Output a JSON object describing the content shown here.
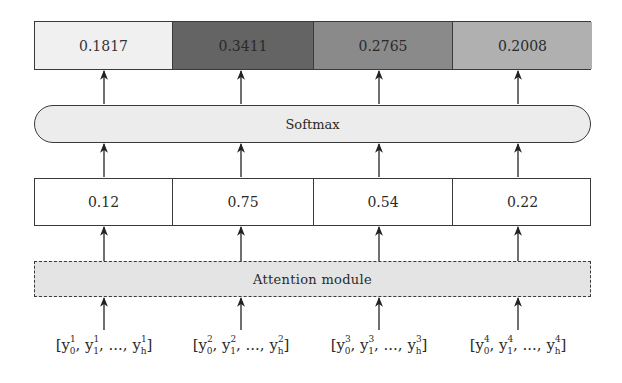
{
  "diagram": {
    "probabilities": [
      {
        "value": "0.1817",
        "fill": "#f0f0f0",
        "text_color": "#333333"
      },
      {
        "value": "0.3411",
        "fill": "#646464",
        "text_color": "#2a2a2a"
      },
      {
        "value": "0.2765",
        "fill": "#8a8a8a",
        "text_color": "#2a2a2a"
      },
      {
        "value": "0.2008",
        "fill": "#b0b0b0",
        "text_color": "#2a2a2a"
      }
    ],
    "softmax_label": "Softmax",
    "scores": [
      "0.12",
      "0.75",
      "0.54",
      "0.22"
    ],
    "attention_label": "Attention module",
    "inputs": [
      {
        "open": "[",
        "items": [
          {
            "base": "y",
            "sup": "1",
            "sub": "0"
          },
          {
            "base": "y",
            "sup": "1",
            "sub": "1"
          },
          {
            "base": "y",
            "sup": "1",
            "sub": "h"
          }
        ],
        "ellipsis": "...",
        "close": "]"
      },
      {
        "open": "[",
        "items": [
          {
            "base": "y",
            "sup": "2",
            "sub": "0"
          },
          {
            "base": "y",
            "sup": "2",
            "sub": "1"
          },
          {
            "base": "y",
            "sup": "2",
            "sub": "h"
          }
        ],
        "ellipsis": "...",
        "close": "]"
      },
      {
        "open": "[",
        "items": [
          {
            "base": "y",
            "sup": "3",
            "sub": "0"
          },
          {
            "base": "y",
            "sup": "3",
            "sub": "1"
          },
          {
            "base": "y",
            "sup": "3",
            "sub": "h"
          }
        ],
        "ellipsis": "...",
        "close": "]"
      },
      {
        "open": "[",
        "items": [
          {
            "base": "y",
            "sup": "4",
            "sub": "0"
          },
          {
            "base": "y",
            "sup": "4",
            "sub": "1"
          },
          {
            "base": "y",
            "sup": "4",
            "sub": "h"
          }
        ],
        "ellipsis": "...",
        "close": "]"
      }
    ],
    "column_centers": [
      104,
      241,
      379,
      518
    ],
    "column_widths": [
      137,
      141,
      139,
      140
    ]
  }
}
